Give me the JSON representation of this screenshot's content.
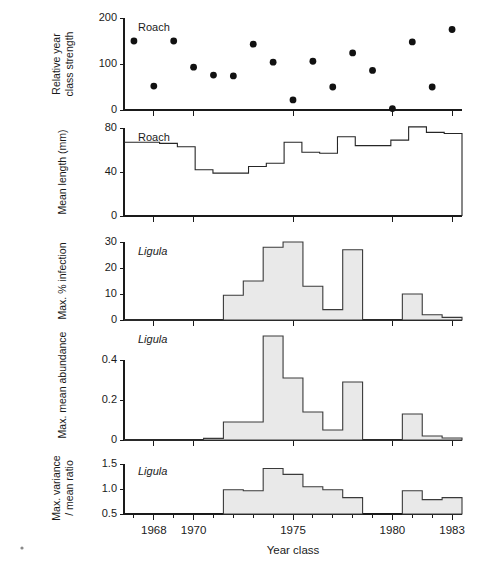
{
  "figure": {
    "xlabel": "Year class",
    "x_tick_labels": [
      "1968",
      "1970",
      "1975",
      "1980",
      "1983"
    ],
    "x_tick_years": [
      1968,
      1970,
      1975,
      1980,
      1983
    ],
    "x_minor_years": [
      1967,
      1969,
      1971,
      1972,
      1973,
      1974,
      1976,
      1977,
      1978,
      1979,
      1981,
      1982
    ],
    "x_range": [
      1966.5,
      1983.5
    ]
  },
  "chart_data": [
    {
      "type": "scatter",
      "panel": 1,
      "title": "",
      "annotation": "Roach",
      "annotation_style": "roman",
      "ylabel": "Relative year class strength",
      "xlabel": "Year class",
      "ylim": [
        0,
        200
      ],
      "ytick_values": [
        0,
        100,
        200
      ],
      "ytick_labels": [
        "0",
        "100",
        "200"
      ],
      "grid": false,
      "x": [
        1967,
        1968,
        1969,
        1970,
        1971,
        1972,
        1973,
        1974,
        1975,
        1976,
        1977,
        1978,
        1979,
        1980,
        1981,
        1982,
        1983
      ],
      "values": [
        150,
        52,
        150,
        93,
        76,
        74,
        143,
        104,
        22,
        106,
        50,
        124,
        86,
        3,
        148,
        50,
        175
      ]
    },
    {
      "type": "area",
      "panel": 2,
      "annotation": "Roach",
      "annotation_style": "roman",
      "ylabel": "Mean length (mm)",
      "xlabel": "Year class",
      "ylim": [
        0,
        80
      ],
      "ytick_values": [
        0,
        40,
        80
      ],
      "ytick_labels": [
        "0",
        "40",
        "80"
      ],
      "grid": false,
      "x": [
        1967,
        1968,
        1969,
        1970,
        1971,
        1972,
        1973,
        1974,
        1975,
        1976,
        1977,
        1978,
        1979,
        1980,
        1981,
        1982,
        1983
      ],
      "values": [
        67,
        67,
        66,
        63,
        63,
        42,
        39,
        39,
        45,
        48,
        50,
        67,
        58,
        57,
        57,
        72,
        64,
        64,
        69,
        81,
        76,
        75
      ],
      "step_values": [
        67,
        67,
        66,
        63,
        42,
        39,
        39,
        45,
        48,
        67,
        58,
        57,
        72,
        64,
        64,
        69,
        81,
        76,
        75
      ]
    },
    {
      "type": "bar",
      "panel": 3,
      "annotation": "Ligula",
      "annotation_style": "italic",
      "ylabel": "Max. % infection",
      "xlabel": "Year class",
      "ylim": [
        0,
        30
      ],
      "ytick_values": [
        0,
        10,
        20,
        30
      ],
      "ytick_labels": [
        "0",
        "10",
        "20",
        "30"
      ],
      "grid": false,
      "categories": [
        1967,
        1968,
        1969,
        1970,
        1971,
        1972,
        1973,
        1974,
        1975,
        1976,
        1977,
        1978,
        1979,
        1980,
        1981,
        1982,
        1983
      ],
      "values": [
        0,
        0,
        0,
        0,
        0,
        9.5,
        15,
        28,
        30,
        13,
        4,
        27,
        0,
        0,
        10,
        2,
        1
      ]
    },
    {
      "type": "bar",
      "panel": 4,
      "annotation": "Ligula",
      "annotation_style": "italic",
      "ylabel": "Max. mean abundance",
      "xlabel": "Year class",
      "ylim": [
        0,
        0.55
      ],
      "ytick_values": [
        0,
        0.2,
        0.4
      ],
      "ytick_labels": [
        "0",
        "0.2",
        "0.4"
      ],
      "grid": false,
      "categories": [
        1967,
        1968,
        1969,
        1970,
        1971,
        1972,
        1973,
        1974,
        1975,
        1976,
        1977,
        1978,
        1979,
        1980,
        1981,
        1982,
        1983
      ],
      "values": [
        0,
        0,
        0,
        0,
        0.008,
        0.09,
        0.09,
        0.52,
        0.31,
        0.14,
        0.05,
        0.29,
        0,
        0,
        0.13,
        0.02,
        0.01
      ]
    },
    {
      "type": "bar",
      "panel": 5,
      "annotation": "Ligula",
      "annotation_style": "italic",
      "ylabel": "Max. variance / mean ratio",
      "ylabel_line1": "Max. variance",
      "ylabel_line2": "/ mean ratio",
      "xlabel": "Year class",
      "ylim": [
        0.5,
        1.55
      ],
      "ytick_values": [
        0.5,
        1.0,
        1.5
      ],
      "ytick_labels": [
        "0.5",
        "1.0",
        "1.5"
      ],
      "grid": false,
      "categories": [
        1967,
        1968,
        1969,
        1970,
        1971,
        1972,
        1973,
        1974,
        1975,
        1976,
        1977,
        1978,
        1979,
        1980,
        1981,
        1982,
        1983
      ],
      "values": [
        null,
        null,
        null,
        null,
        null,
        0.99,
        0.97,
        1.42,
        1.3,
        1.05,
        0.99,
        0.83,
        null,
        null,
        0.97,
        0.79,
        0.83
      ]
    }
  ],
  "colors": {
    "ink": "#1a1a1a",
    "fill": "#e9e9e9",
    "stroke": "#3a3a3a",
    "dot": "#111111"
  }
}
